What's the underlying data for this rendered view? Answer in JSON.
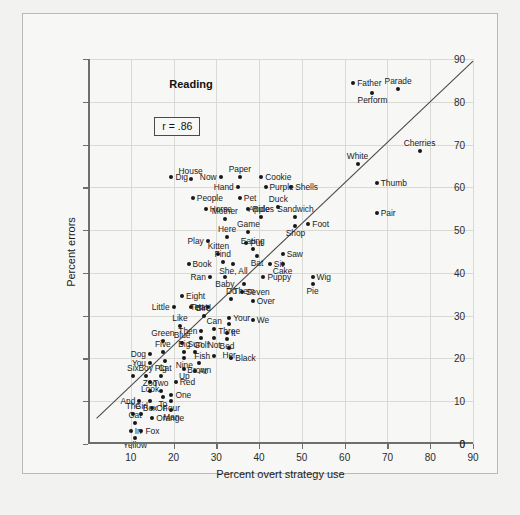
{
  "figure": {
    "panel_title": "Reading",
    "r_annotation": "r = .86"
  },
  "chart_data": {
    "type": "scatter",
    "title": "Reading",
    "xlabel": "Percent overt strategy use",
    "ylabel": "Percent errors",
    "xlim": [
      0,
      90
    ],
    "ylim": [
      0,
      90
    ],
    "xticks": [
      10,
      20,
      30,
      40,
      50,
      60,
      70,
      80,
      90
    ],
    "yticks": [
      0,
      10,
      20,
      30,
      40,
      50,
      60,
      70,
      80,
      90
    ],
    "grid": true,
    "legend": "none",
    "annotations": [
      "r = .86"
    ],
    "correlation": 0.86,
    "regression_line": {
      "x1": 2.0,
      "y1": 6.0,
      "x2": 90.0,
      "y2": 89.5
    },
    "point_label_key": "word",
    "points": [
      {
        "label": "Father",
        "x": 62.0,
        "y": 84.5,
        "pos": "l"
      },
      {
        "label": "Parade",
        "x": 72.5,
        "y": 83.0,
        "pos": "t"
      },
      {
        "label": "Perform",
        "x": 66.5,
        "y": 82.0,
        "pos": "b"
      },
      {
        "label": "Cherries",
        "x": 77.5,
        "y": 68.5,
        "pos": "t"
      },
      {
        "label": "White",
        "x": 63.0,
        "y": 65.5,
        "pos": "t"
      },
      {
        "label": "Thumb",
        "x": 67.5,
        "y": 61.0,
        "pos": "l"
      },
      {
        "label": "Dig",
        "x": 19.5,
        "y": 62.5,
        "pos": "l"
      },
      {
        "label": "House",
        "x": 24.0,
        "y": 62.0,
        "pos": "t"
      },
      {
        "label": "Now",
        "x": 31.0,
        "y": 62.5,
        "pos": "r"
      },
      {
        "label": "Paper",
        "x": 35.5,
        "y": 62.5,
        "pos": "t"
      },
      {
        "label": "Cookie",
        "x": 40.5,
        "y": 62.5,
        "pos": "l"
      },
      {
        "label": "Hand",
        "x": 35.0,
        "y": 60.0,
        "pos": "r"
      },
      {
        "label": "Purple",
        "x": 41.5,
        "y": 60.0,
        "pos": "l"
      },
      {
        "label": "Shells",
        "x": 47.5,
        "y": 60.0,
        "pos": "l"
      },
      {
        "label": "People",
        "x": 24.5,
        "y": 57.5,
        "pos": "l"
      },
      {
        "label": "Pet",
        "x": 35.5,
        "y": 57.5,
        "pos": "l"
      },
      {
        "label": "Horse",
        "x": 27.5,
        "y": 55.0,
        "pos": "l"
      },
      {
        "label": "Ride",
        "x": 37.5,
        "y": 55.0,
        "pos": "l"
      },
      {
        "label": "Duck",
        "x": 44.5,
        "y": 55.5,
        "pos": "t"
      },
      {
        "label": "Pair",
        "x": 67.5,
        "y": 54.0,
        "pos": "l"
      },
      {
        "label": "Mother",
        "x": 32.0,
        "y": 52.5,
        "pos": "t"
      },
      {
        "label": "Apples",
        "x": 40.5,
        "y": 53.0,
        "pos": "t"
      },
      {
        "label": "Sandwich",
        "x": 48.5,
        "y": 53.0,
        "pos": "t"
      },
      {
        "label": "Foot",
        "x": 51.5,
        "y": 51.5,
        "pos": "l"
      },
      {
        "label": "Shop",
        "x": 48.5,
        "y": 51.0,
        "pos": "b"
      },
      {
        "label": "Game",
        "x": 37.5,
        "y": 49.5,
        "pos": "t"
      },
      {
        "label": "Here",
        "x": 32.5,
        "y": 48.5,
        "pos": "t"
      },
      {
        "label": "Play",
        "x": 28.0,
        "y": 47.5,
        "pos": "r"
      },
      {
        "label": "Put",
        "x": 37.0,
        "y": 47.0,
        "pos": "l"
      },
      {
        "label": "Eating",
        "x": 38.5,
        "y": 45.5,
        "pos": "t"
      },
      {
        "label": "Bat",
        "x": 39.5,
        "y": 44.0,
        "pos": "b"
      },
      {
        "label": "Kitten",
        "x": 30.5,
        "y": 44.5,
        "pos": "t"
      },
      {
        "label": "Saw",
        "x": 45.5,
        "y": 44.5,
        "pos": "l"
      },
      {
        "label": "Find",
        "x": 31.5,
        "y": 42.5,
        "pos": "t"
      },
      {
        "label": "She, All",
        "x": 34.0,
        "y": 42.0,
        "pos": "b"
      },
      {
        "label": "Sit",
        "x": 42.5,
        "y": 42.0,
        "pos": "l"
      },
      {
        "label": "Cake",
        "x": 45.5,
        "y": 42.0,
        "pos": "b"
      },
      {
        "label": "Book",
        "x": 23.5,
        "y": 42.0,
        "pos": "l"
      },
      {
        "label": "Ran",
        "x": 28.5,
        "y": 39.0,
        "pos": "r"
      },
      {
        "label": "Baby",
        "x": 32.0,
        "y": 39.0,
        "pos": "b"
      },
      {
        "label": "Puppy",
        "x": 41.0,
        "y": 39.0,
        "pos": "l"
      },
      {
        "label": "Wig",
        "x": 52.5,
        "y": 39.0,
        "pos": "l"
      },
      {
        "label": "Pie",
        "x": 52.5,
        "y": 37.5,
        "pos": "b"
      },
      {
        "label": "Them",
        "x": 36.5,
        "y": 37.5,
        "pos": "b"
      },
      {
        "label": "Seven",
        "x": 36.0,
        "y": 35.5,
        "pos": "l"
      },
      {
        "label": "Eight",
        "x": 22.0,
        "y": 34.5,
        "pos": "l"
      },
      {
        "label": "Do",
        "x": 33.5,
        "y": 34.0,
        "pos": "t"
      },
      {
        "label": "Over",
        "x": 38.5,
        "y": 33.5,
        "pos": "l"
      },
      {
        "label": "Little",
        "x": 20.0,
        "y": 32.0,
        "pos": "r"
      },
      {
        "label": "Hat",
        "x": 24.0,
        "y": 32.0,
        "pos": "l"
      },
      {
        "label": "Ten",
        "x": 28.0,
        "y": 32.0,
        "pos": "r"
      },
      {
        "label": "Bird",
        "x": 27.0,
        "y": 30.0,
        "pos": "t"
      },
      {
        "label": "Your",
        "x": 33.0,
        "y": 29.5,
        "pos": "l"
      },
      {
        "label": "We",
        "x": 38.5,
        "y": 29.0,
        "pos": "l"
      },
      {
        "label": "Three",
        "x": 33.0,
        "y": 28.0,
        "pos": "b"
      },
      {
        "label": "Like",
        "x": 21.5,
        "y": 27.5,
        "pos": "t"
      },
      {
        "label": "Can",
        "x": 29.5,
        "y": 27.0,
        "pos": "t"
      },
      {
        "label": "Then",
        "x": 26.5,
        "y": 26.5,
        "pos": "r"
      },
      {
        "label": "It",
        "x": 32.5,
        "y": 26.0,
        "pos": "l"
      },
      {
        "label": "Golf",
        "x": 26.5,
        "y": 24.8,
        "pos": "b"
      },
      {
        "label": "Not",
        "x": 29.5,
        "y": 24.8,
        "pos": "b"
      },
      {
        "label": "Bed",
        "x": 32.5,
        "y": 24.5,
        "pos": "b"
      },
      {
        "label": "Green",
        "x": 17.5,
        "y": 24.0,
        "pos": "t"
      },
      {
        "label": "Blue",
        "x": 22.0,
        "y": 23.5,
        "pos": "t"
      },
      {
        "label": "Her",
        "x": 33.0,
        "y": 22.5,
        "pos": "b"
      },
      {
        "label": "Big",
        "x": 22.5,
        "y": 21.5,
        "pos": "t"
      },
      {
        "label": "Sun",
        "x": 25.0,
        "y": 21.5,
        "pos": "t"
      },
      {
        "label": "Dog",
        "x": 14.5,
        "y": 21.0,
        "pos": "r"
      },
      {
        "label": "Five",
        "x": 17.5,
        "y": 21.5,
        "pos": "t"
      },
      {
        "label": "Fish",
        "x": 29.5,
        "y": 20.5,
        "pos": "r"
      },
      {
        "label": "Black",
        "x": 33.5,
        "y": 20.0,
        "pos": "l"
      },
      {
        "label": "Nine",
        "x": 22.5,
        "y": 20.0,
        "pos": "b"
      },
      {
        "label": "Cat",
        "x": 18.0,
        "y": 19.5,
        "pos": "b"
      },
      {
        "label": "You",
        "x": 14.5,
        "y": 19.0,
        "pos": "r"
      },
      {
        "label": "Brown",
        "x": 26.0,
        "y": 19.0,
        "pos": "b"
      },
      {
        "label": "Up",
        "x": 22.5,
        "y": 17.5,
        "pos": "b"
      },
      {
        "label": "At",
        "x": 25.0,
        "y": 17.0,
        "pos": "l"
      },
      {
        "label": "Six",
        "x": 10.5,
        "y": 16.0,
        "pos": "t"
      },
      {
        "label": "Boy",
        "x": 13.5,
        "y": 16.0,
        "pos": "t"
      },
      {
        "label": "Pig",
        "x": 17.0,
        "y": 16.0,
        "pos": "t"
      },
      {
        "label": "Look",
        "x": 14.5,
        "y": 14.5,
        "pos": "b"
      },
      {
        "label": "Red",
        "x": 20.5,
        "y": 14.5,
        "pos": "l"
      },
      {
        "label": "Zoo",
        "x": 14.5,
        "y": 12.5,
        "pos": "t"
      },
      {
        "label": "Two",
        "x": 17.0,
        "y": 12.5,
        "pos": "t"
      },
      {
        "label": "One",
        "x": 19.5,
        "y": 11.5,
        "pos": "l"
      },
      {
        "label": "To",
        "x": 17.5,
        "y": 11.0,
        "pos": "b"
      },
      {
        "label": "And",
        "x": 12.0,
        "y": 10.0,
        "pos": "r"
      },
      {
        "label": "Box",
        "x": 14.5,
        "y": 10.0,
        "pos": "b"
      },
      {
        "label": "Four",
        "x": 19.5,
        "y": 10.0,
        "pos": "b"
      },
      {
        "label": "On",
        "x": 15.0,
        "y": 8.5,
        "pos": "l"
      },
      {
        "label": "Man",
        "x": 19.5,
        "y": 8.0,
        "pos": "b"
      },
      {
        "label": "The",
        "x": 10.5,
        "y": 7.0,
        "pos": "t"
      },
      {
        "label": "Girl",
        "x": 12.5,
        "y": 7.0,
        "pos": "t"
      },
      {
        "label": "Orange",
        "x": 15.0,
        "y": 6.0,
        "pos": "l"
      },
      {
        "label": "Cat2",
        "x": 11.0,
        "y": 5.0,
        "pos": "t"
      },
      {
        "label": "In",
        "x": 10.0,
        "y": 3.0,
        "pos": "l"
      },
      {
        "label": "Fox",
        "x": 12.5,
        "y": 3.0,
        "pos": "l"
      },
      {
        "label": "Yellow",
        "x": 11.0,
        "y": 1.5,
        "pos": "b"
      }
    ]
  }
}
